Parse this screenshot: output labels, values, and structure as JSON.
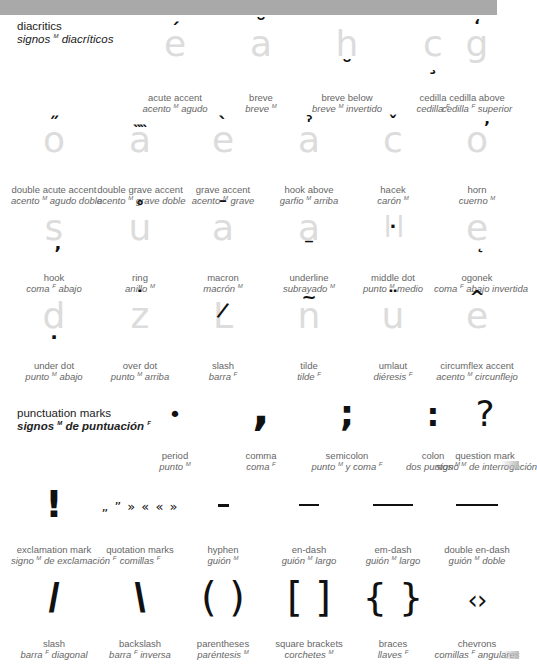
{
  "sections": {
    "diacritics": {
      "title_en": "diacritics",
      "title_es_pre": "signos",
      "title_es_gender": "M",
      "title_es_post": " diacríticos",
      "items": [
        {
          "en": "acute accent",
          "es_pre": "acento",
          "gender": "M",
          "es_post": " agudo",
          "base": "e",
          "mark": "´"
        },
        {
          "en": "breve",
          "es_pre": "breve",
          "gender": "M",
          "es_post": "",
          "base": "a",
          "mark": "˘"
        },
        {
          "en": "breve below",
          "es_pre": "breve",
          "gender": "M",
          "es_post": " invertido",
          "base": "h",
          "mark": "˘"
        },
        {
          "en": "cedilla",
          "es_pre": "cedilla",
          "gender": "F",
          "es_post": "",
          "base": "c",
          "mark": "¸"
        },
        {
          "en": "cedilla above",
          "es_pre": "cedilla",
          "gender": "F",
          "es_post": " superior",
          "base": "g",
          "mark": "‘"
        },
        {
          "en": "double acute accent",
          "es_pre": "acento",
          "gender": "M",
          "es_post": " agudo doble",
          "base": "o",
          "mark": "˝"
        },
        {
          "en": "double grave accent",
          "es_pre": "acento",
          "gender": "M",
          "es_post": " grave doble",
          "base": "a",
          "mark": "˵˵"
        },
        {
          "en": "grave accent",
          "es_pre": "acento",
          "gender": "M",
          "es_post": " grave",
          "base": "e",
          "mark": "`"
        },
        {
          "en": "hook above",
          "es_pre": "garfio",
          "gender": "M",
          "es_post": " arriba",
          "base": "a",
          "mark": "ˀ"
        },
        {
          "en": "hacek",
          "es_pre": "carón",
          "gender": "M",
          "es_post": "",
          "base": "c",
          "mark": "ˇ"
        },
        {
          "en": "horn",
          "es_pre": "cuerno",
          "gender": "M",
          "es_post": "",
          "base": "o",
          "mark": "ʼ"
        },
        {
          "en": "hook",
          "es_pre": "coma",
          "gender": "F",
          "es_post": " abajo",
          "base": "s",
          "mark": ","
        },
        {
          "en": "ring",
          "es_pre": "anillo",
          "gender": "M",
          "es_post": "",
          "base": "u",
          "mark": "˚"
        },
        {
          "en": "macron",
          "es_pre": "macrón",
          "gender": "M",
          "es_post": "",
          "base": "a",
          "mark": "¯"
        },
        {
          "en": "underline",
          "es_pre": "subrayado",
          "gender": "M",
          "es_post": "",
          "base": "a",
          "mark": "_"
        },
        {
          "en": "middle dot",
          "es_pre": "punto",
          "gender": "M",
          "es_post": " medio",
          "base": "l l",
          "mark": "·"
        },
        {
          "en": "ogonek",
          "es_pre": "coma",
          "gender": "F",
          "es_post": " abajo invertida",
          "base": "e",
          "mark": "˛"
        },
        {
          "en": "under dot",
          "es_pre": "punto",
          "gender": "M",
          "es_post": " abajo",
          "base": "d",
          "mark": "."
        },
        {
          "en": "over dot",
          "es_pre": "punto",
          "gender": "M",
          "es_post": " arriba",
          "base": "z",
          "mark": "˙"
        },
        {
          "en": "slash",
          "es_pre": "barra",
          "gender": "F",
          "es_post": "",
          "base": "L",
          "mark": "/"
        },
        {
          "en": "tilde",
          "es_pre": "tilde",
          "gender": "F",
          "es_post": "",
          "base": "n",
          "mark": "~"
        },
        {
          "en": "umlaut",
          "es_pre": "diéresis",
          "gender": "F",
          "es_post": "",
          "base": "u",
          "mark": "¨"
        },
        {
          "en": "circumflex accent",
          "es_pre": "acento",
          "gender": "M",
          "es_post": " circunflejo",
          "base": "e",
          "mark": "^"
        }
      ]
    },
    "punctuation": {
      "title_en": "punctuation marks",
      "title_es_pre": "signos",
      "title_es_gender": "M",
      "title_es_post": " de puntuación",
      "title_es_gender2": "F",
      "items": [
        {
          "en": "period",
          "es_pre": "punto",
          "gender": "M",
          "es_post": "",
          "symbol": "•"
        },
        {
          "en": "comma",
          "es_pre": "coma",
          "gender": "F",
          "es_post": "",
          "symbol": ","
        },
        {
          "en": "semicolon",
          "es_pre": "punto",
          "gender": "M",
          "es_post": " y coma",
          "gender2": "F",
          "symbol": ";"
        },
        {
          "en": "colon",
          "es_pre": "dos puntos",
          "gender": "M",
          "es_post": "",
          "symbol": ":"
        },
        {
          "en": "question mark",
          "es_pre": "signo",
          "gender": "M",
          "es_post": " de interrogación",
          "symbol": "?"
        },
        {
          "en": "exclamation mark",
          "es_pre": "signo",
          "gender": "M",
          "es_post": " de exclamación",
          "gender2": "F",
          "symbol": "!"
        },
        {
          "en": "quotation marks",
          "es_pre": "comillas",
          "gender": "F",
          "es_post": "",
          "symbol": "„ ” » « « »"
        },
        {
          "en": "hyphen",
          "es_pre": "guión",
          "gender": "M",
          "es_post": "",
          "symbol": "hyphen"
        },
        {
          "en": "en-dash",
          "es_pre": "guión",
          "gender": "M",
          "es_post": " largo",
          "symbol": "en-dash"
        },
        {
          "en": "em-dash",
          "es_pre": "guión",
          "gender": "M",
          "es_post": " largo",
          "symbol": "em-dash"
        },
        {
          "en": "double en-dash",
          "es_pre": "guión",
          "gender": "M",
          "es_post": " doble",
          "symbol": "double-en-dash"
        },
        {
          "en": "slash",
          "es_pre": "barra",
          "gender": "F",
          "es_post": " diagonal",
          "symbol": "/"
        },
        {
          "en": "backslash",
          "es_pre": "barra",
          "gender": "F",
          "es_post": " inversa",
          "symbol": "\\"
        },
        {
          "en": "parentheses",
          "es_pre": "paréntesis",
          "gender": "M",
          "es_post": "",
          "symbol": "( )"
        },
        {
          "en": "square brackets",
          "es_pre": "corchetes",
          "gender": "M",
          "es_post": "",
          "symbol": "[ ]"
        },
        {
          "en": "braces",
          "es_pre": "llaves",
          "gender": "F",
          "es_post": "",
          "symbol": "{ }"
        },
        {
          "en": "chevrons",
          "es_pre": "comillas",
          "gender": "F",
          "es_post": " angulares",
          "symbol": "‹›"
        }
      ]
    }
  },
  "colors": {
    "topbar": "#a9a9a9",
    "base_letter": "#dcdcdc",
    "mark": "#111111",
    "label": "#666666"
  }
}
